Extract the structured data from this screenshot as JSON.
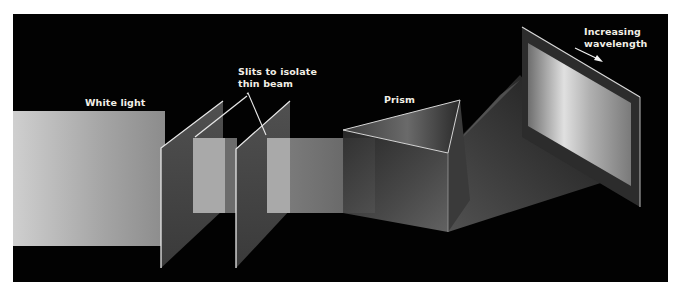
{
  "figure": {
    "background_color": "#ffffff",
    "panel_color": "#020202",
    "label_color": "#f2efe6"
  },
  "labels": {
    "white_light": "White light",
    "slits_line1": "Slits to isolate",
    "slits_line2": "thin beam",
    "prism": "Prism",
    "wavelength_line1": "Increasing",
    "wavelength_line2": "wavelength"
  },
  "elements": {
    "white_light_beam": {
      "color_left": "#c8c8c8",
      "color_right": "#8a8a8a"
    },
    "slit_panel_color": "#4a4a4a",
    "slit_edge_color": "#e8e8e8",
    "thin_beam_color": "#9c9c9c",
    "prism_edge_color": "#d8d8d8",
    "screen_color": "#a8a8a8",
    "arrow": {
      "direction": "down-right",
      "meaning": "increasing-wavelength"
    }
  }
}
